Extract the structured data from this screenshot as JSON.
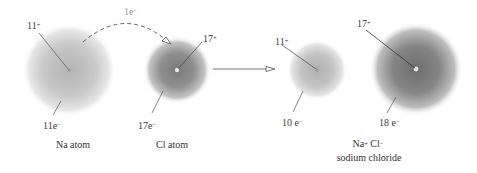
{
  "diagram": {
    "transfer": {
      "label_num": "1e",
      "label_sup": "−"
    },
    "reactants": {
      "na_atom": {
        "nucleus_num": "11",
        "nucleus_sup": "+",
        "electrons_num": "11e",
        "electrons_sup": "−",
        "caption": "Na atom"
      },
      "cl_atom": {
        "nucleus_num": "17",
        "nucleus_sup": "+",
        "electrons_num": "17e",
        "electrons_sup": "−",
        "caption": "Cl atom"
      }
    },
    "products": {
      "na_ion": {
        "nucleus_num": "11",
        "nucleus_sup": "+",
        "electrons_num": "10 e",
        "electrons_sup": "−"
      },
      "cl_ion": {
        "nucleus_num": "17",
        "nucleus_sup": "+",
        "electrons_num": "18 e",
        "electrons_sup": "−"
      },
      "formula_na": "Na",
      "formula_na_sup": "+",
      "formula_cl": " Cl",
      "formula_cl_sup": "−",
      "caption": "sodium chloride"
    },
    "colors": {
      "cloud_light": "#bdbdbd",
      "cloud_dark": "#7a7a7a",
      "line": "#444444",
      "transfer_label": "#9a9a9a"
    }
  }
}
